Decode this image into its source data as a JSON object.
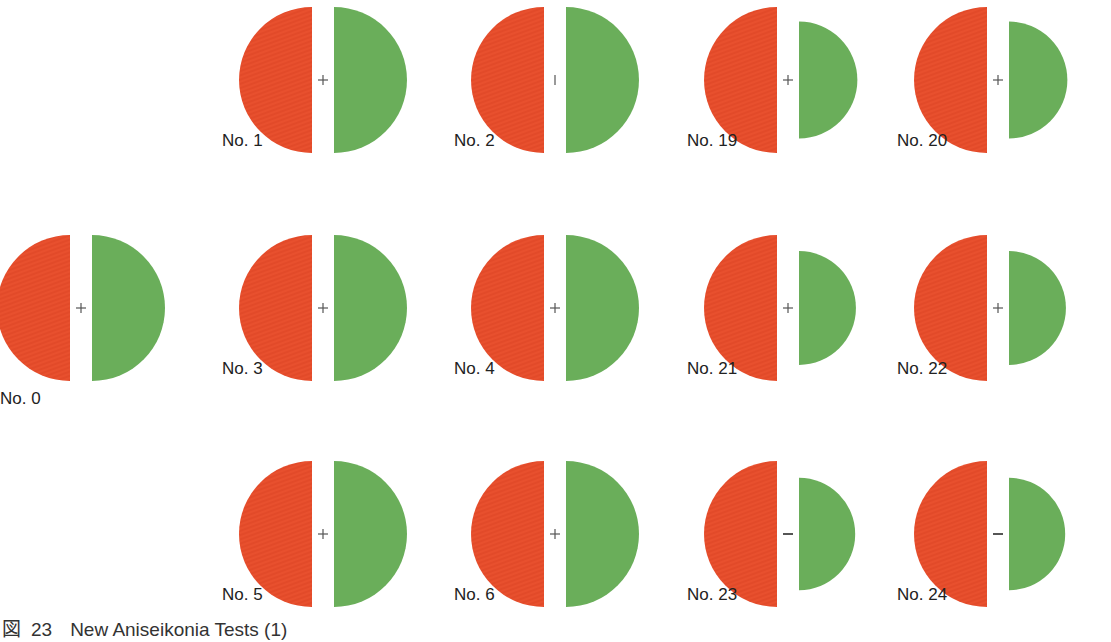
{
  "figure": {
    "caption_prefix": "図",
    "caption_number": "23",
    "caption_title": "New Aniseikonia Tests (1)",
    "colors": {
      "red_half": "#e8502e",
      "green_half": "#6aae5a",
      "fixation_mark": "#555555",
      "background": "#ffffff"
    },
    "tests": [
      {
        "label": "No. 0",
        "row": "middle",
        "col": 0,
        "green_scale": 1.0,
        "mark": "+"
      },
      {
        "label": "No. 1",
        "row": "top",
        "col": 1,
        "green_scale": 1.0,
        "mark": "+"
      },
      {
        "label": "No. 2",
        "row": "top",
        "col": 2,
        "green_scale": 1.0,
        "mark": "|"
      },
      {
        "label": "No. 19",
        "row": "top",
        "col": 3,
        "green_scale": 0.8,
        "mark": "+"
      },
      {
        "label": "No. 20",
        "row": "top",
        "col": 4,
        "green_scale": 0.8,
        "mark": "+"
      },
      {
        "label": "No. 3",
        "row": "middle",
        "col": 1,
        "green_scale": 1.0,
        "mark": "+"
      },
      {
        "label": "No. 4",
        "row": "middle",
        "col": 2,
        "green_scale": 1.0,
        "mark": "+"
      },
      {
        "label": "No. 21",
        "row": "middle",
        "col": 3,
        "green_scale": 0.78,
        "mark": "+"
      },
      {
        "label": "No. 22",
        "row": "middle",
        "col": 4,
        "green_scale": 0.78,
        "mark": "+"
      },
      {
        "label": "No. 5",
        "row": "bottom",
        "col": 1,
        "green_scale": 1.0,
        "mark": "+"
      },
      {
        "label": "No. 6",
        "row": "bottom",
        "col": 2,
        "green_scale": 1.0,
        "mark": "+"
      },
      {
        "label": "No. 23",
        "row": "bottom",
        "col": 3,
        "green_scale": 0.77,
        "mark": "-"
      },
      {
        "label": "No. 24",
        "row": "bottom",
        "col": 4,
        "green_scale": 0.77,
        "mark": "-"
      }
    ]
  }
}
